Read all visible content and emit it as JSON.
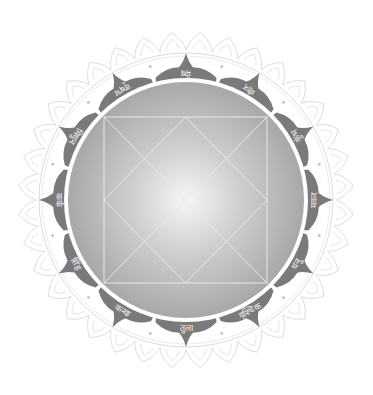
{
  "chart": {
    "title": "",
    "type": "north-indian-kundli-wheel",
    "colors": {
      "background": "#ffffff",
      "petal": "#7a7a7a",
      "inner_disc_center": "#f4f4f4",
      "inner_disc_edge": "#a9a9a9",
      "grid_lines": "#e6e6e6",
      "lace": "#d4d4d4",
      "label_text": "#f2f2f2"
    },
    "signs": [
      {
        "label": "मेष",
        "english": "Aries",
        "angle": 0
      },
      {
        "label": "मीन",
        "english": "Pisces",
        "angle": 30
      },
      {
        "label": "कुंभ",
        "english": "Aquarius",
        "angle": 60
      },
      {
        "label": "मकर",
        "english": "Capricorn",
        "angle": 90
      },
      {
        "label": "धनु",
        "english": "Sagittarius",
        "angle": 120
      },
      {
        "label": "वृश्चिक",
        "english": "Scorpio",
        "angle": 150
      },
      {
        "label": "तुला",
        "english": "Libra",
        "angle": 180
      },
      {
        "label": "कन्या",
        "english": "Virgo",
        "angle": 210
      },
      {
        "label": "सिंह",
        "english": "Leo",
        "angle": 240
      },
      {
        "label": "कर्क",
        "english": "Cancer",
        "angle": 270
      },
      {
        "label": "मिथुन",
        "english": "Gemini",
        "angle": 300
      },
      {
        "label": "वृषभ",
        "english": "Taurus",
        "angle": 330
      }
    ]
  }
}
